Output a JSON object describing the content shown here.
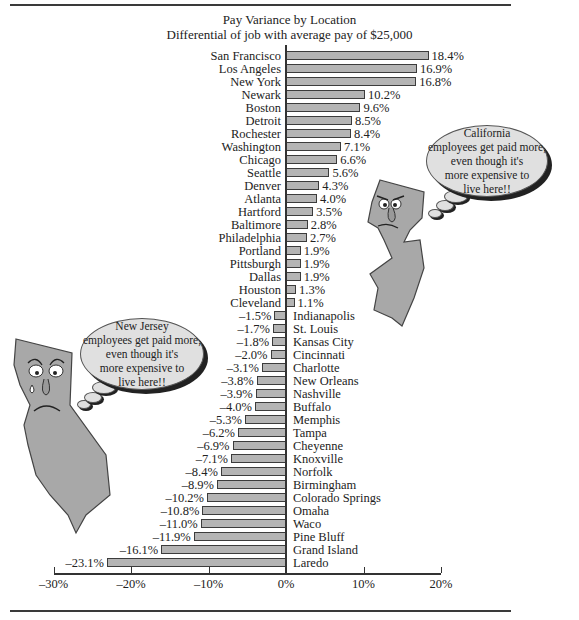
{
  "title": "Pay Variance by Location",
  "subtitle": "Differential of job with average pay of $25,000",
  "chart_data": {
    "type": "bar",
    "orientation": "horizontal",
    "title": "Pay Variance by Location",
    "subtitle": "Differential of job with average pay of $25,000",
    "xlabel": "",
    "ylabel": "",
    "xlim": [
      -30,
      20
    ],
    "x_ticks": [
      "-30%",
      "-20%",
      "-10%",
      "0%",
      "10%",
      "20%"
    ],
    "grid": false,
    "legend": null,
    "categories": [
      "San Francisco",
      "Los Angeles",
      "New York",
      "Newark",
      "Boston",
      "Detroit",
      "Rochester",
      "Washington",
      "Chicago",
      "Seattle",
      "Denver",
      "Atlanta",
      "Hartford",
      "Baltimore",
      "Philadelphia",
      "Portland",
      "Pittsburgh",
      "Dallas",
      "Houston",
      "Cleveland",
      "Indianapolis",
      "St. Louis",
      "Kansas City",
      "Cincinnati",
      "Charlotte",
      "New Orleans",
      "Nashville",
      "Buffalo",
      "Memphis",
      "Tampa",
      "Cheyenne",
      "Knoxville",
      "Norfolk",
      "Birmingham",
      "Colorado Springs",
      "Omaha",
      "Waco",
      "Pine Bluff",
      "Grand Island",
      "Laredo"
    ],
    "values": [
      18.4,
      16.9,
      16.8,
      10.2,
      9.6,
      8.5,
      8.4,
      7.1,
      6.6,
      5.6,
      4.3,
      4.0,
      3.5,
      2.8,
      2.7,
      1.9,
      1.9,
      1.9,
      1.3,
      1.1,
      -1.5,
      -1.7,
      -1.8,
      -2.0,
      -3.1,
      -3.8,
      -3.9,
      -4.0,
      -5.3,
      -6.2,
      -6.9,
      -7.1,
      -8.4,
      -8.9,
      -10.2,
      -10.8,
      -11.0,
      -11.9,
      -16.1,
      -23.1
    ],
    "value_labels": [
      "18.4%",
      "16.9%",
      "16.8%",
      "10.2%",
      "9.6%",
      "8.5%",
      "8.4%",
      "7.1%",
      "6.6%",
      "5.6%",
      "4.3%",
      "4.0%",
      "3.5%",
      "2.8%",
      "2.7%",
      "1.9%",
      "1.9%",
      "1.9%",
      "1.3%",
      "1.1%",
      "–1.5%",
      "–1.7%",
      "–1.8%",
      "–2.0%",
      "–3.1%",
      "–3.8%",
      "–3.9%",
      "–4.0%",
      "–5.3%",
      "–6.2%",
      "–6.9%",
      "–7.1%",
      "–8.4%",
      "–8.9%",
      "–10.2%",
      "–10.8%",
      "–11.0%",
      "–11.9%",
      "–16.1%",
      "–23.1%"
    ],
    "annotations": [
      "California employees get paid more, even though it's more expensive to live here!!",
      "New Jersey employees get paid more, even though it's more expensive to live here!!"
    ]
  },
  "axis": {
    "ticks": [
      {
        "label": "–30%",
        "value": -30
      },
      {
        "label": "–20%",
        "value": -20
      },
      {
        "label": "–10%",
        "value": -10
      },
      {
        "label": "0%",
        "value": 0
      },
      {
        "label": "10%",
        "value": 10
      },
      {
        "label": "20%",
        "value": 20
      }
    ]
  },
  "bubbles": {
    "nj": {
      "lines": [
        "California",
        "employees get paid more,",
        "even though it's",
        "more expensive to",
        "live here!!"
      ]
    },
    "ca": {
      "lines": [
        "New Jersey",
        "employees get paid more,",
        "even though it's",
        "more expensive to",
        "live here!!"
      ]
    }
  },
  "colors": {
    "bar_fill": "#b4b4b4",
    "bar_border": "#3c3c3c",
    "state_fill": "#a8a8a8",
    "bubble_fill": "#e0e0e0"
  }
}
